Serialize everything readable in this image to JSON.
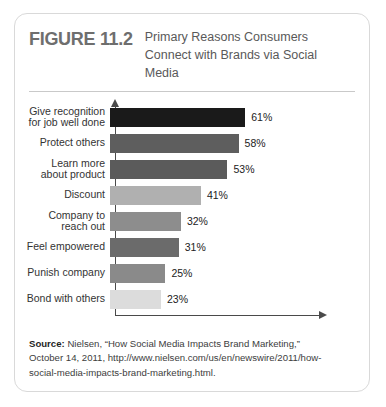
{
  "figure": {
    "number": "FIGURE 11.2",
    "title_lines": [
      "Primary Reasons Consumers",
      "Connect with Brands via Social",
      "Media"
    ]
  },
  "chart_data": {
    "type": "bar",
    "orientation": "horizontal",
    "title": "Primary Reasons Consumers Connect with Brands via Social Media",
    "xlabel": "",
    "ylabel": "",
    "xlim": [
      0,
      70
    ],
    "grid": false,
    "legend": false,
    "value_suffix": "%",
    "categories": [
      "Give recognition for job well done",
      "Protect others",
      "Learn more about product",
      "Discount",
      "Company to reach out",
      "Feel empowered",
      "Punish company",
      "Bond with others"
    ],
    "values": [
      61,
      58,
      53,
      41,
      32,
      31,
      25,
      23
    ],
    "value_labels": [
      "61%",
      "58%",
      "53%",
      "41%",
      "32%",
      "31%",
      "25%",
      "23%"
    ],
    "bar_colors": [
      "#1a1a1a",
      "#5e5e5e",
      "#5b5b5b",
      "#b0b0b0",
      "#8d8d8d",
      "#6b6b6b",
      "#8a8a8a",
      "#dcdcdc"
    ],
    "bars": [
      {
        "label_lines": [
          "Give recognition",
          "for job well done"
        ],
        "value": 61,
        "value_label": "61%",
        "color": "#1a1a1a"
      },
      {
        "label_lines": [
          "Protect others"
        ],
        "value": 58,
        "value_label": "58%",
        "color": "#5e5e5e"
      },
      {
        "label_lines": [
          "Learn more",
          "about product"
        ],
        "value": 53,
        "value_label": "53%",
        "color": "#5b5b5b"
      },
      {
        "label_lines": [
          "Discount"
        ],
        "value": 41,
        "value_label": "41%",
        "color": "#b0b0b0"
      },
      {
        "label_lines": [
          "Company to",
          "reach out"
        ],
        "value": 32,
        "value_label": "32%",
        "color": "#8d8d8d"
      },
      {
        "label_lines": [
          "Feel empowered"
        ],
        "value": 31,
        "value_label": "31%",
        "color": "#6b6b6b"
      },
      {
        "label_lines": [
          "Punish company"
        ],
        "value": 25,
        "value_label": "25%",
        "color": "#8a8a8a"
      },
      {
        "label_lines": [
          "Bond with others"
        ],
        "value": 23,
        "value_label": "23%",
        "color": "#dcdcdc"
      }
    ]
  },
  "source": {
    "label": "Source:",
    "lines": [
      " Nielsen, “How Social Media Impacts Brand Marketing,”",
      "October 14, 2011, http://www.nielsen.com/us/en/newswire/2011/how-",
      "social-media-impacts-brand-marketing.html."
    ]
  }
}
